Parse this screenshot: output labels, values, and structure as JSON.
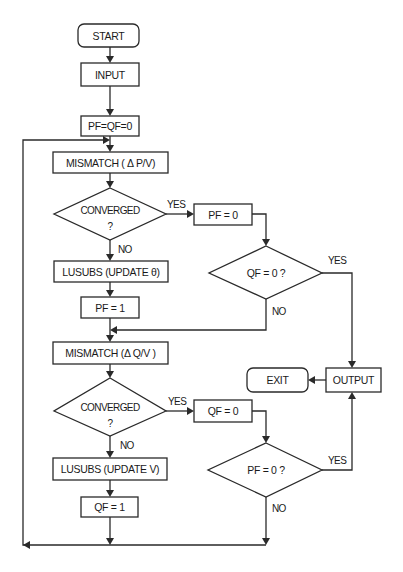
{
  "diagram": {
    "type": "flowchart",
    "nodes": {
      "start": "START",
      "input": "INPUT",
      "init": "PF=QF=0",
      "mismatch_p": "MISMATCH ( Δ  P/V)",
      "converged_p_line1": "CONVERGED",
      "converged_p_line2": "?",
      "pf_zero": "PF = 0",
      "qf_check": "QF  =  0 ?",
      "lusubs_theta": "LUSUBS  (UPDATE θ)",
      "pf_one": "PF = 1",
      "mismatch_q": "MISMATCH  (Δ  Q/V )",
      "converged_q_line1": "CONVERGED",
      "converged_q_line2": "?",
      "qf_zero": "QF = 0",
      "pf_check": "PF  =  0 ?",
      "lusubs_v": "LUSUBS  (UPDATE V)",
      "qf_one": "QF = 1",
      "exit": "EXIT",
      "output": "OUTPUT"
    },
    "edge_labels": {
      "converged_p_yes": "YES",
      "converged_p_no": "NO",
      "qf_check_yes": "YES",
      "qf_check_no": "NO",
      "converged_q_yes": "YES",
      "converged_q_no": "NO",
      "pf_check_yes": "YES",
      "pf_check_no": "NO"
    },
    "edges": [
      [
        "START",
        "INPUT"
      ],
      [
        "INPUT",
        "PF=QF=0"
      ],
      [
        "PF=QF=0",
        "MISMATCH (ΔP/V)"
      ],
      [
        "MISMATCH (ΔP/V)",
        "CONVERGED? (P)"
      ],
      [
        "CONVERGED? (P)",
        "PF = 0",
        "YES"
      ],
      [
        "CONVERGED? (P)",
        "LUSUBS (UPDATE θ)",
        "NO"
      ],
      [
        "PF = 0",
        "QF = 0 ?"
      ],
      [
        "QF = 0 ?",
        "OUTPUT",
        "YES"
      ],
      [
        "QF = 0 ?",
        "MISMATCH (ΔQ/V)",
        "NO"
      ],
      [
        "LUSUBS (UPDATE θ)",
        "PF = 1"
      ],
      [
        "PF = 1",
        "MISMATCH (ΔQ/V)"
      ],
      [
        "MISMATCH (ΔQ/V)",
        "CONVERGED? (Q)"
      ],
      [
        "CONVERGED? (Q)",
        "QF = 0",
        "YES"
      ],
      [
        "CONVERGED? (Q)",
        "LUSUBS (UPDATE V)",
        "NO"
      ],
      [
        "QF = 0",
        "PF = 0 ?"
      ],
      [
        "PF = 0 ?",
        "OUTPUT",
        "YES"
      ],
      [
        "PF = 0 ?",
        "MISMATCH (ΔP/V)",
        "NO"
      ],
      [
        "LUSUBS (UPDATE V)",
        "QF = 1"
      ],
      [
        "QF = 1",
        "MISMATCH (ΔP/V)"
      ],
      [
        "OUTPUT",
        "EXIT"
      ]
    ]
  }
}
